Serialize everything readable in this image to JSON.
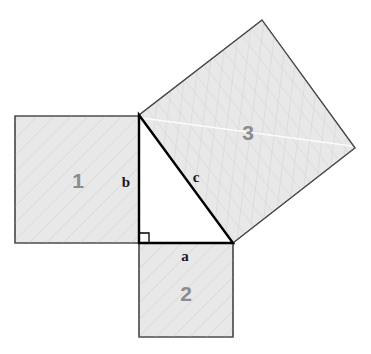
{
  "figure": {
    "name": "pythagorean-theorem-diagram",
    "background_color": "#ffffff",
    "square_fill": "#e8e8e8",
    "square_stroke": "#4d4d4d",
    "triangle_stroke": "#000000",
    "number_label_color": "#8c8c8c",
    "side_label_color": "#1a1a1a",
    "hatch_color": "#d6d6d6"
  },
  "squares": [
    {
      "id": "square-1",
      "label": "1",
      "label_x": 78,
      "label_y": 188,
      "points": "15,116 139,116 139,243 15,243",
      "attached_side": "b",
      "hatch": "hatch-axis"
    },
    {
      "id": "square-2",
      "label": "2",
      "label_x": 186,
      "label_y": 301,
      "points": "139,243 233,243 233,337 139,337",
      "attached_side": "a",
      "hatch": "hatch-axis"
    },
    {
      "id": "square-3",
      "label": "3",
      "label_x": 248,
      "label_y": 140,
      "points": "139,115 262,20 355,148 233,243",
      "attached_side": "c",
      "hatch": "hatch-rot"
    }
  ],
  "triangle": {
    "id": "right-triangle",
    "points": "139,115 139,243 233,243",
    "right_angle_vertex": {
      "x": 139,
      "y": 243
    },
    "right_angle_marker": "139,233 149,233 149,243"
  },
  "side_labels": [
    {
      "id": "label-a",
      "text": "a",
      "x": 185,
      "y": 261
    },
    {
      "id": "label-b",
      "text": "b",
      "x": 126,
      "y": 187
    },
    {
      "id": "label-c",
      "text": "c",
      "x": 196,
      "y": 182
    }
  ]
}
